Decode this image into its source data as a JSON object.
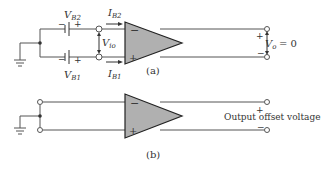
{
  "figure_a": {
    "label": "(a)",
    "vb2": {
      "main": "V",
      "sub": "B2"
    },
    "vb1": {
      "main": "V",
      "sub": "B1"
    },
    "ib2": {
      "main": "I",
      "sub": "B2"
    },
    "ib1": {
      "main": "I",
      "sub": "B1"
    },
    "vio": {
      "main": "V",
      "sub": "io"
    },
    "vo": {
      "main": "V",
      "sub": "o",
      "eq": "= 0"
    },
    "minus": "−",
    "plus": "+"
  },
  "figure_b": {
    "label": "(b)",
    "output_label": "Output offset voltage",
    "minus": "−",
    "plus": "+"
  },
  "colors": {
    "wire": "#555555",
    "opamp_fill": "#b0b0b0",
    "opamp_stroke": "#222222"
  }
}
